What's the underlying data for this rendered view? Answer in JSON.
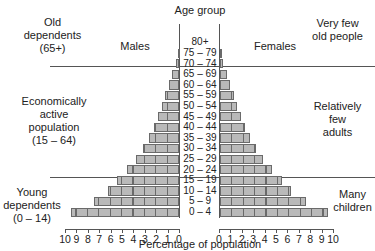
{
  "chart_data": {
    "type": "bar",
    "subtype": "population-pyramid",
    "title": "",
    "xlabel": "Percentage of population",
    "ylabel": "Age group",
    "xlim": [
      0,
      10
    ],
    "categories": [
      "0 – 4",
      "5 – 9",
      "10 – 14",
      "15 – 19",
      "20 – 24",
      "25 – 29",
      "30 – 34",
      "35 – 39",
      "40 – 44",
      "45 – 49",
      "50 – 54",
      "55 – 59",
      "60 – 64",
      "65 – 69",
      "70 – 74",
      "75 – 79",
      "80+"
    ],
    "series": [
      {
        "name": "Males",
        "values": [
          9.5,
          7.5,
          6.2,
          5.4,
          4.6,
          3.8,
          3.2,
          2.6,
          2.2,
          1.8,
          1.5,
          1.2,
          0.9,
          0.6,
          0.3,
          0.1,
          0.0
        ]
      },
      {
        "name": "Females",
        "values": [
          9.5,
          7.5,
          6.2,
          5.4,
          4.6,
          3.8,
          3.2,
          2.6,
          2.2,
          1.8,
          1.5,
          1.2,
          0.9,
          0.6,
          0.3,
          0.1,
          0.0
        ]
      }
    ],
    "male_ticks": [
      "10",
      "9",
      "8",
      "7",
      "6",
      "5",
      "4",
      "3",
      "2",
      "1",
      "0"
    ],
    "female_ticks": [
      "0",
      "1",
      "2",
      "3",
      "4",
      "5",
      "6",
      "7",
      "8",
      "9",
      "10"
    ],
    "annotations_left": [
      {
        "text": "Old dependents (65+)"
      },
      {
        "text": "Economically active population (15 – 64)"
      },
      {
        "text": "Young dependents (0 – 14)"
      }
    ],
    "annotations_right": [
      {
        "text": "Very few old people"
      },
      {
        "text": "Relatively few adults"
      },
      {
        "text": "Many children"
      }
    ],
    "side_labels": {
      "left": "Males",
      "right": "Females"
    },
    "grid": false,
    "legend": "none"
  },
  "labels": {
    "age_group": "Age group",
    "males": "Males",
    "females": "Females",
    "xlabel": "Percentage of population",
    "old_dep_1": "Old",
    "old_dep_2": "dependents",
    "old_dep_3": "(65+)",
    "econ_1": "Economically",
    "econ_2": "active",
    "econ_3": "population",
    "econ_4": "(15 – 64)",
    "young_1": "Young",
    "young_2": "dependents",
    "young_3": "(0 – 14)",
    "vfew_1": "Very few",
    "vfew_2": "old people",
    "rel_1": "Relatively",
    "rel_2": "few",
    "rel_3": "adults",
    "many_1": "Many",
    "many_2": "children"
  }
}
